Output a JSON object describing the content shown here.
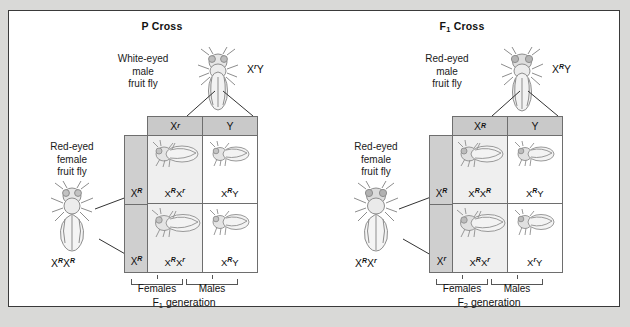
{
  "figure": {
    "background_color": "#d9d9d7",
    "frame_color": "#3a3a3a",
    "header_fill": "#c9c9c9",
    "side_fill": "#cfcfcf",
    "female_cell_fill": "#efefef",
    "male_cell_fill": "#ffffff"
  },
  "panels": [
    {
      "id": "p-cross",
      "title": "P Cross",
      "title_sub": "",
      "male_parent": {
        "label": "White-eyed\nmale\nfruit fly",
        "genotype_plain": "XrY",
        "genotype_parts": [
          {
            "base": "X",
            "allele": "r"
          },
          {
            "base": "Y",
            "allele": ""
          }
        ],
        "icon": "fruit-fly-male"
      },
      "female_parent": {
        "label": "Red-eyed\nfemale\nfruit fly",
        "genotype_plain": "XRXR",
        "genotype_parts": [
          {
            "base": "X",
            "allele": "R"
          },
          {
            "base": "X",
            "allele": "R"
          }
        ],
        "icon": "fruit-fly-female"
      },
      "punnett": {
        "column_headers": [
          {
            "base": "X",
            "allele": "r"
          },
          {
            "base": "Y",
            "allele": ""
          }
        ],
        "row_headers": [
          {
            "base": "X",
            "allele": "R"
          },
          {
            "base": "X",
            "allele": "R"
          }
        ],
        "cells": [
          {
            "sex": "female",
            "parts": [
              {
                "base": "X",
                "allele": "R"
              },
              {
                "base": "X",
                "allele": "r"
              }
            ],
            "plain": "XRXr"
          },
          {
            "sex": "male",
            "parts": [
              {
                "base": "X",
                "allele": "R"
              },
              {
                "base": "Y",
                "allele": ""
              }
            ],
            "plain": "XRY"
          },
          {
            "sex": "female",
            "parts": [
              {
                "base": "X",
                "allele": "R"
              },
              {
                "base": "X",
                "allele": "r"
              }
            ],
            "plain": "XRXr"
          },
          {
            "sex": "male",
            "parts": [
              {
                "base": "X",
                "allele": "R"
              },
              {
                "base": "Y",
                "allele": ""
              }
            ],
            "plain": "XRY"
          }
        ]
      },
      "brackets": {
        "female_label": "Females",
        "male_label": "Males"
      },
      "generation_caption": "generation",
      "generation_symbol": "F",
      "generation_sub": "1"
    },
    {
      "id": "f1-cross",
      "title": "F",
      "title_sub": "1",
      "title_suffix": " Cross",
      "male_parent": {
        "label": "Red-eyed\nmale\nfruit fly",
        "genotype_plain": "XRY",
        "genotype_parts": [
          {
            "base": "X",
            "allele": "R"
          },
          {
            "base": "Y",
            "allele": ""
          }
        ],
        "icon": "fruit-fly-male"
      },
      "female_parent": {
        "label": "Red-eyed\nfemale fly",
        "label_display": "Red-eyed\nfemale\nfruit fly",
        "genotype_plain": "XRXr",
        "genotype_parts": [
          {
            "base": "X",
            "allele": "R"
          },
          {
            "base": "X",
            "allele": "r"
          }
        ],
        "icon": "fruit-fly-female"
      },
      "punnett": {
        "column_headers": [
          {
            "base": "X",
            "allele": "R"
          },
          {
            "base": "Y",
            "allele": ""
          }
        ],
        "row_headers": [
          {
            "base": "X",
            "allele": "R"
          },
          {
            "base": "X",
            "allele": "r"
          }
        ],
        "cells": [
          {
            "sex": "female",
            "parts": [
              {
                "base": "X",
                "allele": "R"
              },
              {
                "base": "X",
                "allele": "R"
              }
            ],
            "plain": "XRXR"
          },
          {
            "sex": "male",
            "parts": [
              {
                "base": "X",
                "allele": "R"
              },
              {
                "base": "Y",
                "allele": ""
              }
            ],
            "plain": "XRY"
          },
          {
            "sex": "female",
            "parts": [
              {
                "base": "X",
                "allele": "R"
              },
              {
                "base": "X",
                "allele": "r"
              }
            ],
            "plain": "XRXr"
          },
          {
            "sex": "male",
            "parts": [
              {
                "base": "X",
                "allele": "r"
              },
              {
                "base": "Y",
                "allele": ""
              }
            ],
            "plain": "XrY"
          }
        ]
      },
      "brackets": {
        "female_label": "Females",
        "male_label": "Males"
      },
      "generation_caption": "generation",
      "generation_symbol": "F",
      "generation_sub": "2"
    }
  ]
}
